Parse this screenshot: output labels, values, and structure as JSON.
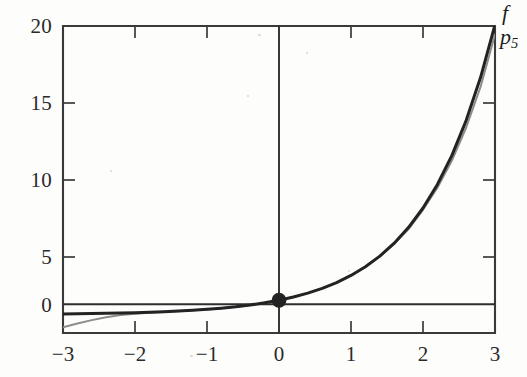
{
  "figure": {
    "background_color": "#fdfdfc",
    "ink_color": "#262626",
    "axis_color": "#3a3a3a"
  },
  "labels": {
    "f_label": "f",
    "p_label": "p",
    "p_subscript": "5"
  },
  "chart_data": {
    "type": "line",
    "title": "",
    "subtitle": "",
    "xlabel": "",
    "ylabel": "",
    "xlim": [
      -3,
      3
    ],
    "ylim": [
      -1.27,
      20
    ],
    "grid": false,
    "legend_position": "right-of-axes-top",
    "xticks": [
      -3,
      -2,
      -1,
      0,
      1,
      2,
      3
    ],
    "xtick_labels": [
      "−3",
      "−2",
      "−1",
      "0",
      "1",
      "2",
      "3"
    ],
    "yticks": [
      0,
      5,
      10,
      15,
      20
    ],
    "ytick_labels": [
      "0",
      "5",
      "10",
      "15",
      "20"
    ],
    "annotations": [
      {
        "name": "tangency-point",
        "x": 0,
        "y": 1,
        "marker": "filled-circle",
        "color": "#232323"
      }
    ],
    "series": [
      {
        "name": "f",
        "label": "f",
        "color": "#232323",
        "width": 3.0,
        "x": [
          -3.0,
          -2.8,
          -2.6,
          -2.4,
          -2.2,
          -2.0,
          -1.8,
          -1.6,
          -1.4,
          -1.2,
          -1.0,
          -0.8,
          -0.6,
          -0.4,
          -0.2,
          0.0,
          0.2,
          0.4,
          0.6,
          0.8,
          1.0,
          1.2,
          1.4,
          1.6,
          1.8,
          2.0,
          2.2,
          2.4,
          2.6,
          2.8,
          3.0
        ],
        "values": [
          0.0498,
          0.0608,
          0.0743,
          0.0907,
          0.1108,
          0.1353,
          0.1653,
          0.2019,
          0.2466,
          0.3012,
          0.3679,
          0.4493,
          0.5488,
          0.6703,
          0.8187,
          1.0,
          1.2214,
          1.4918,
          1.8221,
          2.2255,
          2.7183,
          3.3201,
          4.0552,
          4.953,
          6.0496,
          7.3891,
          9.025,
          11.0232,
          13.4637,
          16.4446,
          20.0855
        ]
      },
      {
        "name": "p5",
        "label": "p5",
        "color": "#8e8c8a",
        "width": 2.0,
        "x": [
          -3.0,
          -2.8,
          -2.6,
          -2.4,
          -2.2,
          -2.0,
          -1.8,
          -1.6,
          -1.4,
          -1.2,
          -1.0,
          -0.8,
          -0.6,
          -0.4,
          -0.2,
          0.0,
          0.2,
          0.4,
          0.6,
          0.8,
          1.0,
          1.2,
          1.4,
          1.6,
          1.8,
          2.0,
          2.2,
          2.4,
          2.6,
          2.8,
          3.0
        ],
        "values": [
          -0.875,
          -0.6107,
          -0.3786,
          -0.1824,
          -0.0239,
          0.0667,
          0.136,
          0.1919,
          0.2439,
          0.3002,
          0.3667,
          0.4484,
          0.5484,
          0.6702,
          0.8187,
          1.0,
          1.2214,
          1.4918,
          1.822,
          2.2249,
          2.7167,
          3.3146,
          4.0385,
          4.9045,
          5.9324,
          7.2667,
          8.7913,
          10.6653,
          12.967,
          15.7932,
          19.4125
        ]
      }
    ]
  }
}
